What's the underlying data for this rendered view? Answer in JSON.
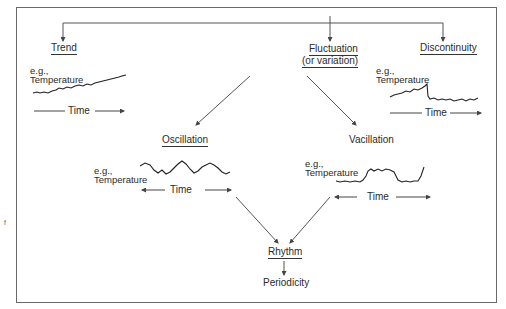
{
  "diagram": {
    "nodes": {
      "trend": "Trend",
      "fluctuation_line1": "Fluctuation",
      "fluctuation_line2": "(or variation)",
      "discontinuity": "Discontinuity",
      "oscillation": "Oscillation",
      "vacillation": "Vacillation",
      "rhythm": "Rhythm",
      "periodicity": "Periodicity"
    },
    "examples": {
      "trend": {
        "eg": "e.g.,",
        "variable": "Temperature",
        "axis": "Time"
      },
      "discontinuity": {
        "eg": "e.g.,",
        "variable": "Temperature",
        "axis": "Time"
      },
      "oscillation": {
        "eg": "e.g.,",
        "variable": "Temperature",
        "axis": "Time"
      },
      "vacillation": {
        "eg": "e.g.,",
        "variable": "Temperature",
        "axis": "Time"
      }
    },
    "edges": [
      {
        "from": "root",
        "to": "Trend"
      },
      {
        "from": "root",
        "to": "Fluctuation (or variation)"
      },
      {
        "from": "root",
        "to": "Discontinuity"
      },
      {
        "from": "Fluctuation (or variation)",
        "to": "Oscillation"
      },
      {
        "from": "Fluctuation (or variation)",
        "to": "Vacillation"
      },
      {
        "from": "Oscillation",
        "to": "Rhythm"
      },
      {
        "from": "Vacillation",
        "to": "Rhythm"
      },
      {
        "from": "Rhythm",
        "to": "Periodicity"
      }
    ],
    "margin_mark": "f"
  },
  "colors": {
    "line": "#555555",
    "text": "#2a2a2a",
    "frame": "#6a6a6a"
  }
}
